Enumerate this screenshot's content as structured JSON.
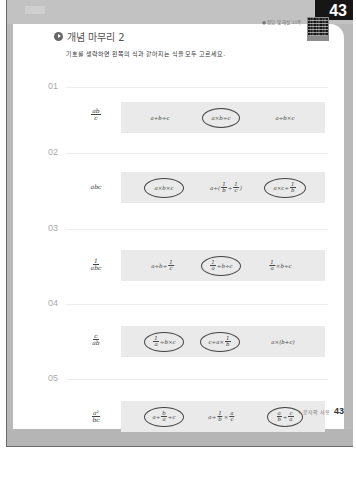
{
  "header": {
    "page_number": "43",
    "answer_reference": "● 정답 및 해설 11쪽"
  },
  "section": {
    "title": "개념 마무리 2",
    "instruction": "기호를 생략하면 왼쪽의 식과 같아지는 식을 모두 고르세요."
  },
  "questions": [
    {
      "number": "01",
      "expression": "ab/c",
      "choices": [
        {
          "text": "a÷b÷c",
          "circled": false
        },
        {
          "text": "a×b÷c",
          "circled": true
        },
        {
          "text": "a÷b×c",
          "circled": false
        }
      ]
    },
    {
      "number": "02",
      "expression": "abc",
      "choices": [
        {
          "text": "a×b×c",
          "circled": true
        },
        {
          "text": "a÷(1/b÷1/c)",
          "circled": false
        },
        {
          "text": "a×c÷1/b",
          "circled": true
        }
      ]
    },
    {
      "number": "03",
      "expression": "1/abc",
      "choices": [
        {
          "text": "a÷b÷1/c",
          "circled": false
        },
        {
          "text": "1/a÷b÷c",
          "circled": true
        },
        {
          "text": "1/a×b÷c",
          "circled": false
        }
      ]
    },
    {
      "number": "04",
      "expression": "c/ab",
      "choices": [
        {
          "text": "1/a÷b×c",
          "circled": true
        },
        {
          "text": "c÷a×1/b",
          "circled": true
        },
        {
          "text": "a×(b+c)",
          "circled": false
        }
      ]
    },
    {
      "number": "05",
      "expression": "a²/bc",
      "choices": [
        {
          "text": "a÷b/a÷c",
          "circled": true
        },
        {
          "text": "a÷1/b×a/c",
          "circled": false
        },
        {
          "text": "a/b÷c/a",
          "circled": true
        }
      ]
    }
  ],
  "footer": {
    "chapter": "I. 문자의 사용",
    "page_number": "43"
  }
}
